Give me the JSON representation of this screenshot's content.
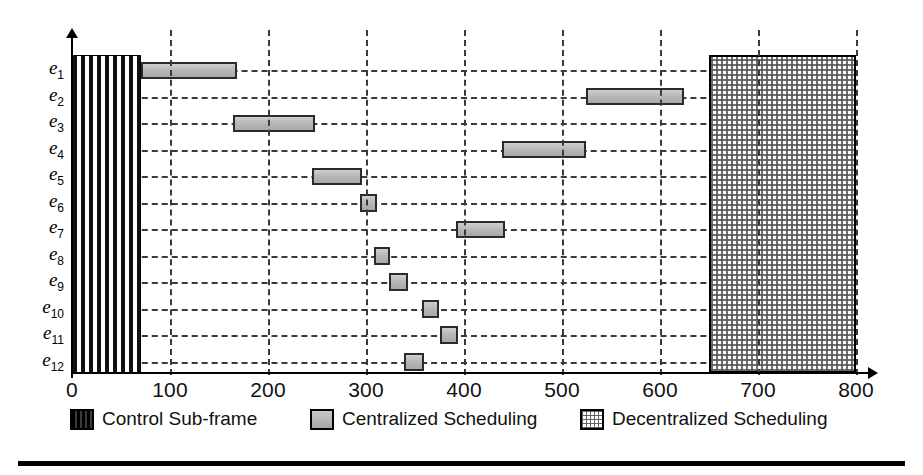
{
  "chart_data": {
    "type": "bar",
    "orientation": "horizontal",
    "title": "",
    "xlabel": "",
    "ylabel": "",
    "xlim": [
      0,
      800
    ],
    "ylim_categories": [
      "e1",
      "e2",
      "e3",
      "e4",
      "e5",
      "e6",
      "e7",
      "e8",
      "e9",
      "e10",
      "e11",
      "e12"
    ],
    "x_ticks": [
      0,
      100,
      200,
      300,
      400,
      500,
      600,
      700,
      800
    ],
    "x_tick_labels": [
      "0",
      "100",
      "200",
      "300",
      "400",
      "500",
      "600",
      "700",
      "800"
    ],
    "grid": true,
    "grid_style": "dashed",
    "legend_position": "below-axes",
    "categories": [
      "e1",
      "e2",
      "e3",
      "e4",
      "e5",
      "e6",
      "e7",
      "e8",
      "e9",
      "e10",
      "e11",
      "e12"
    ],
    "category_labels": [
      {
        "base": "e",
        "sub": "1"
      },
      {
        "base": "e",
        "sub": "2"
      },
      {
        "base": "e",
        "sub": "3"
      },
      {
        "base": "e",
        "sub": "4"
      },
      {
        "base": "e",
        "sub": "5"
      },
      {
        "base": "e",
        "sub": "6"
      },
      {
        "base": "e",
        "sub": "7"
      },
      {
        "base": "e",
        "sub": "8"
      },
      {
        "base": "e",
        "sub": "9"
      },
      {
        "base": "e",
        "sub": "10"
      },
      {
        "base": "e",
        "sub": "11"
      },
      {
        "base": "e",
        "sub": "12"
      }
    ],
    "series": [
      {
        "name": "Control Sub-frame",
        "pattern": "vertical-stripes",
        "color": "#111111",
        "spans_all_rows": true,
        "start": 0,
        "end": 70
      },
      {
        "name": "Centralized Scheduling",
        "pattern": "solid-gray",
        "color": "#b8b8b8",
        "bars": [
          {
            "task": "e1",
            "start": 70,
            "end": 168,
            "duration": 98
          },
          {
            "task": "e2",
            "start": 524,
            "end": 624,
            "duration": 100
          },
          {
            "task": "e3",
            "start": 164,
            "end": 248,
            "duration": 84
          },
          {
            "task": "e4",
            "start": 439,
            "end": 524,
            "duration": 85
          },
          {
            "task": "e5",
            "start": 245,
            "end": 296,
            "duration": 51
          },
          {
            "task": "e6",
            "start": 294,
            "end": 311,
            "duration": 17
          },
          {
            "task": "e7",
            "start": 392,
            "end": 442,
            "duration": 50
          },
          {
            "task": "e8",
            "start": 308,
            "end": 325,
            "duration": 17
          },
          {
            "task": "e9",
            "start": 323,
            "end": 343,
            "duration": 20
          },
          {
            "task": "e10",
            "start": 357,
            "end": 375,
            "duration": 18
          },
          {
            "task": "e11",
            "start": 375,
            "end": 394,
            "duration": 19
          },
          {
            "task": "e12",
            "start": 339,
            "end": 359,
            "duration": 20
          }
        ]
      },
      {
        "name": "Decentralized Scheduling",
        "pattern": "crosshatch-dots",
        "color": "#555555",
        "spans_all_rows": true,
        "start": 650,
        "end": 800
      }
    ]
  },
  "legend": {
    "items": [
      {
        "label": "Control Sub-frame",
        "swatch": "control-swatch"
      },
      {
        "label": "Centralized Scheduling",
        "swatch": "centralized-swatch"
      },
      {
        "label": "Decentralized Scheduling",
        "swatch": "decentralized-swatch"
      }
    ]
  },
  "colors": {
    "axis": "#000000",
    "grid": "#3a3a3a",
    "bar_fill": "#b8b8b8",
    "bar_border": "#2b2b2b",
    "control_frame": "#111111",
    "decentralized": "#555555",
    "background": "#ffffff"
  }
}
